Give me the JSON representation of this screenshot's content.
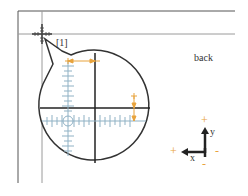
{
  "diagram": {
    "callout_label": "[1]",
    "surface_label": "back",
    "axis": {
      "x_label": "x",
      "y_label": "y",
      "plus_sign": "+",
      "minus_sign": "-"
    },
    "colors": {
      "frame": "#555555",
      "guide": "#999999",
      "reticle": "#222222",
      "scale": "#8fb1c4",
      "offset_marker": "#e8a33c"
    }
  }
}
